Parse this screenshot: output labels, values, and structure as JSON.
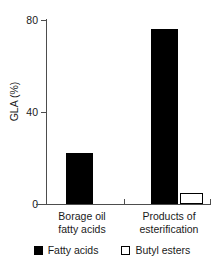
{
  "chart_data": {
    "type": "bar",
    "title": "",
    "xlabel": "",
    "ylabel": "GLA (%)",
    "ylim": [
      0,
      80
    ],
    "yticks": [
      0,
      40,
      80
    ],
    "ytick_labels": [
      "0",
      "40",
      "80"
    ],
    "grid": false,
    "legend_position": "bottom",
    "categories": [
      "Borage oil fatty acids",
      "Products of esterification"
    ],
    "category_lines": [
      [
        "Borage oil",
        "fatty acids"
      ],
      [
        "Products of",
        "esterification"
      ]
    ],
    "series": [
      {
        "name": "Fatty acids",
        "color": "#000000",
        "style": "filled",
        "values": [
          22,
          76
        ]
      },
      {
        "name": "Butyl esters",
        "color": "#ffffff",
        "style": "open",
        "values": [
          null,
          5
        ]
      }
    ],
    "bars": [
      {
        "label": "Borage oil fatty acids - Fatty acids",
        "series": "Fatty acids",
        "category": "Borage oil fatty acids",
        "value": 22,
        "style": "filled"
      },
      {
        "label": "Products of esterification - Fatty acids",
        "series": "Fatty acids",
        "category": "Products of esterification",
        "value": 76,
        "style": "filled"
      },
      {
        "label": "Products of esterification - Butyl esters",
        "series": "Butyl esters",
        "category": "Products of esterification",
        "value": 5,
        "style": "open"
      }
    ],
    "axis_color": "#4d4d4d",
    "text_color": "#1a1a1a",
    "background": "#ffffff"
  },
  "legend": {
    "items": [
      {
        "label": "Fatty acids",
        "swatch": "filled-square-icon"
      },
      {
        "label": "Butyl esters",
        "swatch": "open-square-icon"
      }
    ]
  }
}
